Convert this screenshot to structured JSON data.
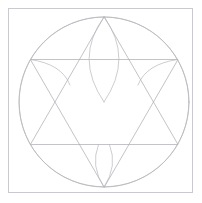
{
  "document": {
    "title": "Geometric Construction Line Drawing",
    "description": "Hexagram with inscribed circle and three circular arcs forming petal shapes, enclosed in a square frame"
  },
  "canvas": {
    "width": 202,
    "height": 203,
    "background_color": "#ffffff"
  },
  "style": {
    "line_color": "#a9a9b0",
    "line_color_soft": "#b7b7bd",
    "frame_color": "#c9c9cf",
    "line_width": 0.7,
    "frame_width": 1.0
  },
  "figure": {
    "frame": {
      "label": "square-frame",
      "x": 8.5,
      "y": 8.5,
      "width": 184,
      "height": 184
    },
    "circle": {
      "label": "outer-circle",
      "cx": 104,
      "cy": 102,
      "r": 85
    },
    "center_point": {
      "label": "center",
      "x": 104,
      "y": 102
    },
    "triangle_up": {
      "label": "upward-triangle",
      "vertices": [
        {
          "name": "apex-top",
          "x": 104,
          "y": 17
        },
        {
          "name": "base-left",
          "x": 30.4,
          "y": 144.5
        },
        {
          "name": "base-right",
          "x": 177.6,
          "y": 144.5
        }
      ]
    },
    "triangle_down": {
      "label": "downward-triangle",
      "vertices": [
        {
          "name": "apex-bottom",
          "x": 104,
          "y": 187
        },
        {
          "name": "top-left",
          "x": 30.4,
          "y": 59.5
        },
        {
          "name": "top-right",
          "x": 177.6,
          "y": 59.5
        }
      ]
    },
    "arcs": [
      {
        "name": "arc-from-top-apex",
        "center_x": 104,
        "center_y": 17,
        "radius": 85,
        "start_x": 30.4,
        "start_y": 144.5,
        "end_x": 177.6,
        "end_y": 144.5
      },
      {
        "name": "arc-from-base-left",
        "center_x": 30.4,
        "center_y": 144.5,
        "radius": 85,
        "start_x": 177.6,
        "start_y": 144.5,
        "end_x": 104,
        "end_y": 17
      },
      {
        "name": "arc-from-base-right",
        "center_x": 177.6,
        "center_y": 144.5,
        "radius": 85,
        "start_x": 104,
        "start_y": 17,
        "end_x": 30.4,
        "end_y": 144.5
      }
    ],
    "petal_arcs": [
      {
        "name": "top-petal-left-edge",
        "from_x": 104,
        "from_y": 17,
        "to_x": 104,
        "to_y": 102,
        "control_x": 76,
        "control_y": 60
      },
      {
        "name": "top-petal-right-edge",
        "from_x": 104,
        "from_y": 17,
        "to_x": 104,
        "to_y": 102,
        "control_x": 132,
        "control_y": 60
      },
      {
        "name": "bottom-petal-left-edge",
        "from_x": 104,
        "from_y": 187,
        "to_x": 104,
        "to_y": 145,
        "control_x": 90,
        "control_y": 165
      },
      {
        "name": "bottom-petal-right-edge",
        "from_x": 104,
        "from_y": 187,
        "to_x": 104,
        "to_y": 145,
        "control_x": 118,
        "control_y": 165
      }
    ],
    "star_points": [
      {
        "name": "star-point-top",
        "x": 104,
        "y": 17
      },
      {
        "name": "star-point-upper-left",
        "x": 30.4,
        "y": 59.5
      },
      {
        "name": "star-point-upper-right",
        "x": 177.6,
        "y": 59.5
      },
      {
        "name": "star-point-lower-left",
        "x": 30.4,
        "y": 144.5
      },
      {
        "name": "star-point-lower-right",
        "x": 177.6,
        "y": 144.5
      },
      {
        "name": "star-point-bottom",
        "x": 104,
        "y": 187
      }
    ]
  }
}
